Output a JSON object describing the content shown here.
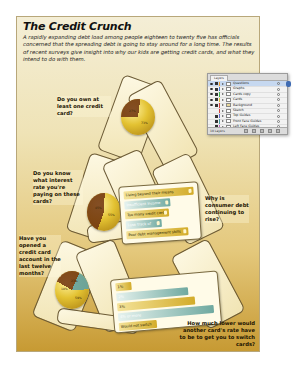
{
  "poster": {
    "title": "The Credit Crunch",
    "intro": "A rapidly expanding debt load among people eighteen to twenty five has officials concerned that the spreading debt is going to stay around for a long time. The results of recent surveys give insight into why our kids are getting credit cards, and what they intend to do with them.",
    "questions": [
      "Do you own at least one credit card?",
      "Do you know what interest rate you're paying on these cards?",
      "Why is consumer debt continuing to rise?",
      "Have you opened a credit card account in the last twelve months?",
      "How much lower would another card's rate have to be to get you to switch cards?"
    ],
    "pies": [
      {
        "labels": [
          "27%",
          "73%"
        ]
      },
      {
        "labels": [
          "45%",
          "55%"
        ]
      },
      {
        "labels": [
          "23%",
          "18%",
          "59%"
        ]
      }
    ],
    "rise_bars": [
      {
        "label": "Living beyond their means",
        "color": "gold"
      },
      {
        "label": "Insufficient income",
        "color": "teal"
      },
      {
        "label": "Too many credit cards",
        "color": "gold"
      },
      {
        "label": "Lose track of charges",
        "color": "teal"
      },
      {
        "label": "Poor debt management skills",
        "color": "gold"
      }
    ],
    "switch_bars": [
      {
        "label": "1%",
        "color": "gold"
      },
      {
        "label": "2%",
        "color": "teal"
      },
      {
        "label": "3%",
        "color": "gold"
      },
      {
        "label": "4% or more",
        "color": "teal"
      },
      {
        "label": "Would not switch",
        "color": "gold"
      }
    ]
  },
  "layers_panel": {
    "tab": "Layers",
    "layers": [
      {
        "name": "Questions",
        "color": "#f0a030",
        "selected": true
      },
      {
        "name": "Graphs",
        "color": "#4a78d0",
        "selected": false
      },
      {
        "name": "Cards copy",
        "color": "#3cae4a",
        "selected": false
      },
      {
        "name": "Cards",
        "color": "#e2c040",
        "selected": false
      },
      {
        "name": "Background",
        "color": "#d04040",
        "selected": false
      },
      {
        "name": "Sketch",
        "color": "#d04040",
        "selected": false
      },
      {
        "name": "Top Guides",
        "color": "#6a6acc",
        "selected": false
      },
      {
        "name": "Front Face Guides",
        "color": "#4a9aa0",
        "selected": false
      },
      {
        "name": "Left Face Guides",
        "color": "#c060c0",
        "selected": false
      },
      {
        "name": "Right Face Guides",
        "color": "#50a050",
        "selected": false
      }
    ],
    "footer": "10 Layers"
  }
}
